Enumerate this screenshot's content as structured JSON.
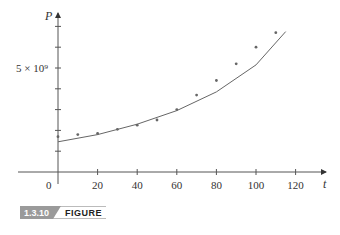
{
  "figure": {
    "number": "1.3.10",
    "label": "FIGURE"
  },
  "axes": {
    "x_var": "t",
    "y_var": "P",
    "origin_label": "0",
    "x_ticks": [
      "20",
      "40",
      "60",
      "80",
      "100",
      "120"
    ],
    "y_tick_label": "5 × 10⁹"
  },
  "chart_data": {
    "type": "scatter",
    "title": "",
    "xlabel": "t",
    "ylabel": "P",
    "xlim": [
      -20,
      130
    ],
    "ylim": [
      -1000000000.0,
      7500000000.0
    ],
    "x_ticks": [
      20,
      40,
      60,
      80,
      100,
      120
    ],
    "y_ticks_minor": [
      1000000000.0,
      2000000000.0,
      3000000000.0,
      4000000000.0,
      5000000000.0,
      6000000000.0,
      7000000000.0
    ],
    "y_tick_labels": [
      {
        "value": 5000000000.0,
        "label": "5 × 10⁹"
      }
    ],
    "grid": false,
    "legend": null,
    "series": [
      {
        "name": "data",
        "kind": "scatter",
        "x": [
          0,
          10,
          20,
          30,
          40,
          50,
          60,
          70,
          80,
          90,
          100,
          110
        ],
        "y": [
          1700000000.0,
          1800000000.0,
          1850000000.0,
          2050000000.0,
          2250000000.0,
          2500000000.0,
          3000000000.0,
          3700000000.0,
          4400000000.0,
          5200000000.0,
          6000000000.0,
          6700000000.0
        ]
      },
      {
        "name": "exponential fit",
        "kind": "line",
        "x": [
          0,
          20,
          40,
          60,
          80,
          100,
          115
        ],
        "y": [
          1450000000.0,
          1800000000.0,
          2300000000.0,
          2950000000.0,
          3850000000.0,
          5150000000.0,
          6750000000.0
        ]
      }
    ]
  }
}
